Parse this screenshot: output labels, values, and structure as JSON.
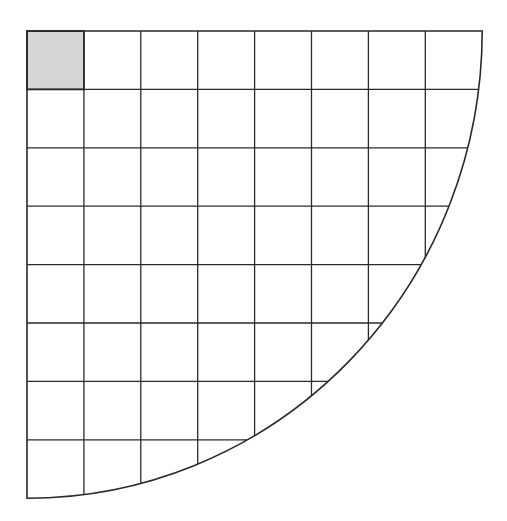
{
  "figure": {
    "canvas": {
      "width": 507,
      "height": 521
    },
    "grid": {
      "rows": 8,
      "cols": 8,
      "visible_row_lines": 7,
      "visible_col_lines": 7
    },
    "geometry": {
      "origin_x": 27,
      "origin_y": 31,
      "cell_width": 56.9,
      "cell_height": 58.4,
      "arc_radius_x": 455.2,
      "arc_radius_y": 467.2,
      "arc_start": "top-right corner of grid",
      "arc_end": "bottom-left corner of grid"
    },
    "shaded_cell": {
      "row": 0,
      "col": 0,
      "fill": "#d7d7d7"
    },
    "colors": {
      "line": "#2a2a2a",
      "fill": "#ffffff",
      "background": "#ffffff",
      "shaded": "#d7d7d7"
    },
    "stroke": {
      "outline_width": 1.6,
      "grid_width": 1.3,
      "shaded_cell_width": 1.8
    }
  }
}
